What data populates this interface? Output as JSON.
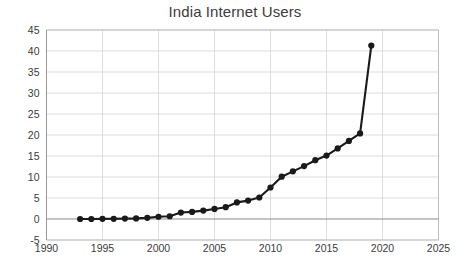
{
  "chart_data": {
    "type": "line",
    "title": "India Internet Users",
    "xlabel": "",
    "ylabel": "",
    "xlim": [
      1990,
      2025
    ],
    "ylim": [
      -5,
      45
    ],
    "xticks": [
      1990,
      1995,
      2000,
      2005,
      2010,
      2015,
      2020,
      2025
    ],
    "yticks": [
      -5,
      0,
      5,
      10,
      15,
      20,
      25,
      30,
      35,
      40,
      45
    ],
    "grid": true,
    "legend": "none",
    "marker": "circle",
    "line_color": "#1a1a1a",
    "grid_color": "#d4d4d4",
    "background_color": "#ffffff",
    "x": [
      1993,
      1994,
      1995,
      1996,
      1997,
      1998,
      1999,
      2000,
      2001,
      2002,
      2003,
      2004,
      2005,
      2006,
      2007,
      2008,
      2009,
      2010,
      2011,
      2012,
      2013,
      2014,
      2015,
      2016,
      2017,
      2018,
      2019
    ],
    "values": [
      0.0,
      0.0,
      0.03,
      0.05,
      0.1,
      0.14,
      0.27,
      0.53,
      0.66,
      1.54,
      1.69,
      2.0,
      2.39,
      2.81,
      3.95,
      4.38,
      5.12,
      7.5,
      10.07,
      12.58,
      15.1,
      18.0,
      21.0,
      29.5,
      34.45,
      20.37,
      41.29
    ],
    "series_name": "India Internet Users",
    "points": [
      {
        "year": 1993,
        "value": 0.0
      },
      {
        "year": 1994,
        "value": 0.0
      },
      {
        "year": 1995,
        "value": 0.03
      },
      {
        "year": 1996,
        "value": 0.05
      },
      {
        "year": 1997,
        "value": 0.1
      },
      {
        "year": 1998,
        "value": 0.14
      },
      {
        "year": 1999,
        "value": 0.27
      },
      {
        "year": 2000,
        "value": 0.53
      },
      {
        "year": 2001,
        "value": 0.66
      },
      {
        "year": 2002,
        "value": 1.54
      },
      {
        "year": 2003,
        "value": 1.69
      },
      {
        "year": 2004,
        "value": 2.0
      },
      {
        "year": 2005,
        "value": 2.39
      },
      {
        "year": 2006,
        "value": 2.81
      },
      {
        "year": 2007,
        "value": 3.95
      },
      {
        "year": 2008,
        "value": 4.38
      },
      {
        "year": 2009,
        "value": 5.12
      },
      {
        "year": 2010,
        "value": 7.5
      },
      {
        "year": 2011,
        "value": 10.07
      },
      {
        "year": 2012,
        "value": 11.35
      },
      {
        "year": 2013,
        "value": 12.6
      },
      {
        "year": 2014,
        "value": 14.0
      },
      {
        "year": 2015,
        "value": 15.1
      },
      {
        "year": 2016,
        "value": 16.8
      },
      {
        "year": 2017,
        "value": 18.6
      },
      {
        "year": 2018,
        "value": 20.37
      },
      {
        "year": 2019,
        "value": 41.29
      }
    ]
  }
}
